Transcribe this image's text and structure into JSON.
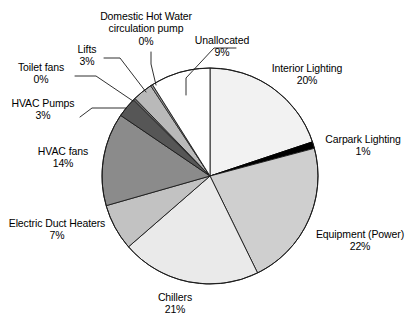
{
  "chart_data": {
    "type": "pie",
    "title": "",
    "subtitle": "",
    "xlabel": "",
    "ylabel": "",
    "legend_position": "callout-labels",
    "grid": false,
    "units": "percent",
    "start_angle_deg": 0,
    "direction": "clockwise",
    "categories": [
      "Interior Lighting",
      "Carpark Lighting",
      "Equipment (Power)",
      "Chillers",
      "Electric Duct Heaters",
      "HVAC fans",
      "HVAC Pumps",
      "Toilet fans",
      "Lifts",
      "Domestic Hot Water circulation pump",
      "Unallocated"
    ],
    "values": [
      20,
      1,
      22,
      21,
      7,
      14,
      3,
      0,
      3,
      0,
      9
    ],
    "labels": [
      "20%",
      "1%",
      "22%",
      "21%",
      "7%",
      "14%",
      "3%",
      "0%",
      "3%",
      "0%",
      "9%"
    ],
    "colors": [
      "#f2f2f2",
      "#000000",
      "#cfcfcf",
      "#eaeaea",
      "#c2c2c2",
      "#8b8b8b",
      "#565656",
      "#6e6e6e",
      "#b9b9b9",
      "#9a9a9a",
      "#ffffff"
    ],
    "slice_outline_color": "#000000"
  },
  "labels": {
    "interior_lighting": {
      "name": "Interior Lighting",
      "value": "20%"
    },
    "carpark_lighting": {
      "name": "Carpark Lighting",
      "value": "1%"
    },
    "equipment_power": {
      "name": "Equipment (Power)",
      "value": "22%"
    },
    "chillers": {
      "name": "Chillers",
      "value": "21%"
    },
    "electric_duct_heaters": {
      "name": "Electric Duct Heaters",
      "value": "7%"
    },
    "hvac_fans": {
      "name": "HVAC fans",
      "value": "14%"
    },
    "hvac_pumps": {
      "name": "HVAC Pumps",
      "value": "3%"
    },
    "toilet_fans": {
      "name": "Toilet fans",
      "value": "0%"
    },
    "lifts": {
      "name": "Lifts",
      "value": "3%"
    },
    "domestic_hot_water": {
      "name_line1": "Domestic Hot Water",
      "name_line2": "circulation pump",
      "value": "0%"
    },
    "unallocated": {
      "name": "Unallocated",
      "value": "9%"
    }
  }
}
